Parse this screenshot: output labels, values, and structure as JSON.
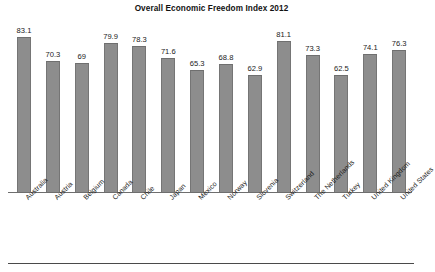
{
  "chart_data": {
    "type": "bar",
    "title": "Overall Economic Freedom Index 2012",
    "xlabel": "",
    "ylabel": "",
    "ylim": [
      0,
      90
    ],
    "grid": false,
    "legend": null,
    "orientation": "vertical",
    "bar_color": "#8d8d8d",
    "data_labels": true,
    "categories": [
      "Australia",
      "Austria",
      "Belgium",
      "Canada",
      "Chile",
      "Japan",
      "Mexico",
      "Norway",
      "Slovenia",
      "Switzerland",
      "The Netherlands",
      "Turkey",
      "United Kingdom",
      "United States"
    ],
    "values": [
      83.1,
      70.3,
      69,
      79.9,
      78.3,
      71.6,
      65.3,
      68.8,
      62.9,
      81.1,
      73.3,
      62.5,
      74.1,
      76.3
    ],
    "value_labels": [
      "83.1",
      "70.3",
      "69",
      "79.9",
      "78.3",
      "71.6",
      "65.3",
      "68.8",
      "62.9",
      "81.1",
      "73.3",
      "62.5",
      "74.1",
      "76.3"
    ]
  },
  "footer": {
    "caption": ""
  }
}
